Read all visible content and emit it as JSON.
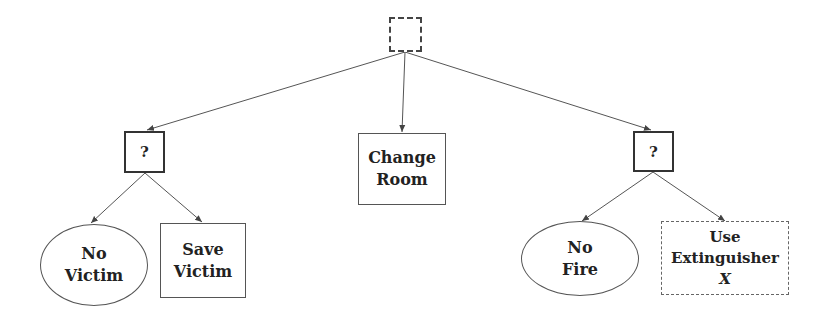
{
  "diagram": {
    "type": "behavior-tree",
    "root": {
      "label": "",
      "style": "dashed-square"
    },
    "nodes": {
      "fallback_left": {
        "label": "?"
      },
      "change_room": {
        "line1": "Change",
        "line2": "Room"
      },
      "fallback_right": {
        "label": "?"
      },
      "no_victim": {
        "line1": "No",
        "line2": "Victim"
      },
      "save_victim": {
        "line1": "Save",
        "line2": "Victim"
      },
      "no_fire": {
        "line1": "No",
        "line2": "Fire"
      },
      "use_extinguisher": {
        "line1": "Use",
        "line2": "Extinguisher",
        "line3": "X"
      }
    },
    "edges": [
      {
        "from": "root",
        "to": "fallback_left"
      },
      {
        "from": "root",
        "to": "change_room"
      },
      {
        "from": "root",
        "to": "fallback_right"
      },
      {
        "from": "fallback_left",
        "to": "no_victim"
      },
      {
        "from": "fallback_left",
        "to": "save_victim"
      },
      {
        "from": "fallback_right",
        "to": "no_fire"
      },
      {
        "from": "fallback_right",
        "to": "use_extinguisher"
      }
    ],
    "colors": {
      "stroke": "#555555",
      "text": "#222222",
      "background": "#ffffff"
    }
  }
}
